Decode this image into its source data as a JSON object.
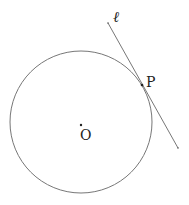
{
  "diagram": {
    "labels": {
      "line": "ℓ",
      "point_p": "P",
      "center": "O"
    },
    "colors": {
      "stroke": "#777777",
      "point": "#222222"
    }
  }
}
